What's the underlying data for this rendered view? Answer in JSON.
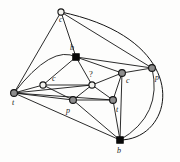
{
  "figure": {
    "background_color": "#fdfdfc",
    "edge_color": "#141414",
    "width": 180,
    "height": 162
  },
  "graph": {
    "nodes": [
      {
        "id": "c_top",
        "label": "c",
        "x": 61,
        "y": 12,
        "style": "open",
        "r": 3.1,
        "label_x": 59,
        "label_y": 22
      },
      {
        "id": "t_left",
        "label": "t",
        "x": 14,
        "y": 93,
        "style": "gray",
        "r": 3.4,
        "label_x": 12,
        "label_y": 105
      },
      {
        "id": "b_upper",
        "label": "b",
        "x": 76,
        "y": 57,
        "style": "black",
        "r": 3.4,
        "label_x": 70,
        "label_y": 50
      },
      {
        "id": "p_right",
        "label": "p",
        "x": 152,
        "y": 68,
        "style": "gray",
        "r": 3.4,
        "label_x": 155,
        "label_y": 80
      },
      {
        "id": "c_left",
        "label": "c",
        "x": 43,
        "y": 85,
        "style": "open",
        "r": 3.1,
        "label_x": 52,
        "label_y": 81
      },
      {
        "id": "q_center",
        "label": "?",
        "x": 92,
        "y": 85,
        "style": "open",
        "r": 3.1,
        "label_x": 89,
        "label_y": 77
      },
      {
        "id": "c_right",
        "label": "c",
        "x": 122,
        "y": 73,
        "style": "gray",
        "r": 3.4,
        "label_x": 126,
        "label_y": 83
      },
      {
        "id": "p_bottom",
        "label": "p",
        "x": 73,
        "y": 100,
        "style": "gray",
        "r": 3.4,
        "label_x": 66,
        "label_y": 113
      },
      {
        "id": "t_bottom",
        "label": "t",
        "x": 113,
        "y": 100,
        "style": "gray",
        "r": 3.4,
        "label_x": 116,
        "label_y": 112
      },
      {
        "id": "b_bottom",
        "label": "b",
        "x": 120,
        "y": 140,
        "style": "black",
        "r": 3.4,
        "label_x": 117,
        "label_y": 153
      }
    ],
    "edges": [
      {
        "from": "c_top",
        "to": "t_left",
        "kind": "straight"
      },
      {
        "from": "c_top",
        "to": "b_upper",
        "kind": "straight"
      },
      {
        "from": "c_top",
        "to": "p_right",
        "kind": "straight"
      },
      {
        "from": "t_left",
        "to": "b_upper",
        "kind": "curve",
        "cx": 52,
        "cy": 44
      },
      {
        "from": "t_left",
        "to": "c_left",
        "kind": "straight"
      },
      {
        "from": "t_left",
        "to": "q_center",
        "kind": "straight"
      },
      {
        "from": "t_left",
        "to": "p_bottom",
        "kind": "straight"
      },
      {
        "from": "t_left",
        "to": "t_bottom",
        "kind": "straight"
      },
      {
        "from": "t_left",
        "to": "b_bottom",
        "kind": "straight"
      },
      {
        "from": "b_upper",
        "to": "c_left",
        "kind": "straight"
      },
      {
        "from": "b_upper",
        "to": "q_center",
        "kind": "straight"
      },
      {
        "from": "b_upper",
        "to": "c_right",
        "kind": "straight"
      },
      {
        "from": "b_upper",
        "to": "p_right",
        "kind": "straight"
      },
      {
        "from": "c_left",
        "to": "q_center",
        "kind": "straight"
      },
      {
        "from": "c_left",
        "to": "p_bottom",
        "kind": "straight"
      },
      {
        "from": "q_center",
        "to": "c_right",
        "kind": "straight"
      },
      {
        "from": "q_center",
        "to": "p_bottom",
        "kind": "straight"
      },
      {
        "from": "q_center",
        "to": "t_bottom",
        "kind": "straight"
      },
      {
        "from": "c_right",
        "to": "p_right",
        "kind": "straight"
      },
      {
        "from": "c_right",
        "to": "t_bottom",
        "kind": "straight"
      },
      {
        "from": "c_right",
        "to": "b_bottom",
        "kind": "straight"
      },
      {
        "from": "p_bottom",
        "to": "t_bottom",
        "kind": "straight"
      },
      {
        "from": "p_bottom",
        "to": "b_bottom",
        "kind": "straight"
      },
      {
        "from": "t_bottom",
        "to": "b_bottom",
        "kind": "straight"
      },
      {
        "from": "p_right",
        "to": "b_bottom",
        "kind": "curve",
        "cx": 163,
        "cy": 115
      },
      {
        "from": "c_top",
        "to": "b_bottom",
        "kind": "curve_outer",
        "cx": 196,
        "cy": 40,
        "cx2": 176,
        "cy2": 140
      }
    ]
  }
}
